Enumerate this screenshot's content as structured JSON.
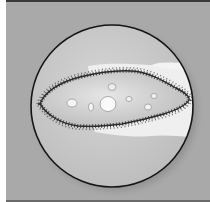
{
  "image": {
    "subject": "paramecium under microscope",
    "colors": {
      "background": "#a9a9a9",
      "frame_border": "#3a3a3a",
      "lens_fill": "#c9c9c9",
      "lens_edge": "#151515",
      "glow": "#efefef",
      "body_fill": "#d4d4d4",
      "cilia": "#2c2c2c",
      "vacuole": "#f7f7f7"
    }
  }
}
